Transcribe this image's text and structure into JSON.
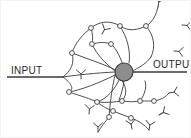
{
  "figure": {
    "background_color": "#ffffff",
    "ink_color": "#3a3a3a",
    "soma_fill_color": "#8d8d8d",
    "soma_stroke_color": "#3a3a3a",
    "node_fill_color": "#ffffff",
    "node_stroke_color": "#3a3a3a"
  },
  "labels": {
    "input": "INPUT",
    "output": "OUTPUT"
  },
  "diagram_data": {
    "type": "node-link-diagram",
    "soma": {
      "cx": 123,
      "cy": 71,
      "r": 9
    },
    "input_line": {
      "x1": 6,
      "y1": 76,
      "x2": 62,
      "y2": 76
    },
    "output_line": {
      "x1": 132,
      "y1": 71,
      "x2": 186,
      "y2": 71
    },
    "input_label_pos": {
      "x": 10,
      "y": 73
    },
    "output_label_pos": {
      "x": 152,
      "y": 67
    },
    "node_count": 14,
    "terminal_count": 11,
    "nodes": [
      {
        "cx": 90,
        "cy": 27
      },
      {
        "cx": 119,
        "cy": 25
      },
      {
        "cx": 145,
        "cy": 25
      },
      {
        "cx": 91,
        "cy": 43
      },
      {
        "cx": 110,
        "cy": 43
      },
      {
        "cx": 71,
        "cy": 52
      },
      {
        "cx": 68,
        "cy": 91
      },
      {
        "cx": 96,
        "cy": 101
      },
      {
        "cx": 121,
        "cy": 100
      },
      {
        "cx": 139,
        "cy": 100
      },
      {
        "cx": 153,
        "cy": 100
      },
      {
        "cx": 112,
        "cy": 110
      },
      {
        "cx": 108,
        "cy": 116
      },
      {
        "cx": 130,
        "cy": 117
      }
    ],
    "branch_paths": [
      "M 62 76 C 70 70 74 62 71 52",
      "M 71 52 C 74 42 82 33 90 27",
      "M 90 27 C 98 20 110 19 119 25",
      "M 119 25 C 128 31 137 29 145 25",
      "M 145 25 C 152 21 155 14 157 6",
      "M 90 27 C 92 34 92 38 91 43",
      "M 91 43 C 99 41 105 41 110 43",
      "M 110 43 C 116 48 120 58 123 67",
      "M 91 43 C 96 54 104 62 114 70",
      "M 119 25 C 126 36 130 50 128 62",
      "M 145 25 C 153 34 155 46 150 56",
      "M 150 56 C 146 62 138 67 131 70",
      "M 71 52 C 84 57 100 62 115 69",
      "M 62 76 C 76 74 94 72 114 71",
      "M 62 76 C 70 82 74 88 68 91",
      "M 68 91 C 80 89 98 82 114 74",
      "M 68 91 C 80 95 90 98 96 101",
      "M 96 101 C 106 98 114 88 118 79",
      "M 96 101 C 106 102 114 101 121 100",
      "M 121 100 C 128 92 124 84 120 78",
      "M 121 100 C 128 101 134 101 139 100",
      "M 139 100 C 146 100 150 100 153 100",
      "M 139 100 C 144 93 146 86 144 80",
      "M 153 100 C 160 99 165 96 168 92",
      "M 96 101 C 102 106 107 108 112 110",
      "M 112 110 C 118 112 124 115 130 117",
      "M 130 117 C 138 120 144 124 148 129",
      "M 108 116 C 104 121 100 126 97 131",
      "M 123 80 C 122 88 120 94 118 99",
      "M 114 74 C 112 84 110 92 108 116"
    ],
    "terminals": [
      {
        "x": 157,
        "y": 6,
        "rot": 10
      },
      {
        "x": 181,
        "y": 24,
        "rot": 95
      },
      {
        "x": 173,
        "y": 50,
        "rot": 95
      },
      {
        "x": 101,
        "y": 33,
        "rot": 30
      },
      {
        "x": 80,
        "y": 78,
        "rot": 0
      },
      {
        "x": 88,
        "y": 113,
        "rot": 5
      },
      {
        "x": 97,
        "y": 131,
        "rot": 0
      },
      {
        "x": 168,
        "y": 92,
        "rot": 80
      },
      {
        "x": 148,
        "y": 129,
        "rot": 10
      },
      {
        "x": 158,
        "y": 114,
        "rot": 60
      },
      {
        "x": 131,
        "y": 128,
        "rot": 350
      }
    ]
  }
}
